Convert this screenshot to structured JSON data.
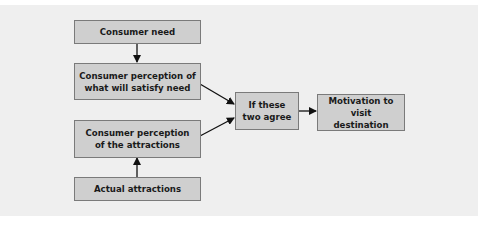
{
  "diagram": {
    "nodes": [
      {
        "id": "consumer-need",
        "label": "Consumer need"
      },
      {
        "id": "perception-satisfy",
        "label": "Consumer perception of\nwhat will satisfy need"
      },
      {
        "id": "perception-attractions",
        "label": "Consumer perception\nof the attractions"
      },
      {
        "id": "actual-attractions",
        "label": "Actual attractions"
      },
      {
        "id": "if-agree",
        "label": "If these\ntwo agree"
      },
      {
        "id": "motivation",
        "label": "Motivation to\nvisit destination"
      }
    ],
    "edges": [
      {
        "from": "consumer-need",
        "to": "perception-satisfy"
      },
      {
        "from": "actual-attractions",
        "to": "perception-attractions"
      },
      {
        "from": "perception-satisfy",
        "to": "if-agree"
      },
      {
        "from": "perception-attractions",
        "to": "if-agree"
      },
      {
        "from": "if-agree",
        "to": "motivation"
      }
    ],
    "colors": {
      "panel": "#efefef",
      "box_fill": "#cfcfcf",
      "box_border": "#7a7a7a",
      "arrow": "#111111"
    }
  }
}
